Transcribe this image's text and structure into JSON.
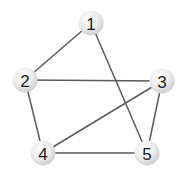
{
  "diagram": {
    "type": "undirected-graph",
    "node_radius": 12.5,
    "colors": {
      "background": "#ffffff",
      "edge": "#5a5a5a",
      "node_fill_light": "#ffffff",
      "node_fill_dark": "#cfcfcf",
      "label": "#1a1a1a"
    },
    "nodes": [
      {
        "id": "1",
        "label": "1",
        "x": 91,
        "y": 23
      },
      {
        "id": "2",
        "label": "2",
        "x": 25,
        "y": 80
      },
      {
        "id": "3",
        "label": "3",
        "x": 162,
        "y": 81
      },
      {
        "id": "4",
        "label": "4",
        "x": 43,
        "y": 153
      },
      {
        "id": "5",
        "label": "5",
        "x": 147,
        "y": 153
      }
    ],
    "edges": [
      {
        "from": "1",
        "to": "2"
      },
      {
        "from": "1",
        "to": "5"
      },
      {
        "from": "2",
        "to": "3"
      },
      {
        "from": "2",
        "to": "4"
      },
      {
        "from": "3",
        "to": "4"
      },
      {
        "from": "3",
        "to": "5"
      },
      {
        "from": "4",
        "to": "5"
      }
    ]
  }
}
